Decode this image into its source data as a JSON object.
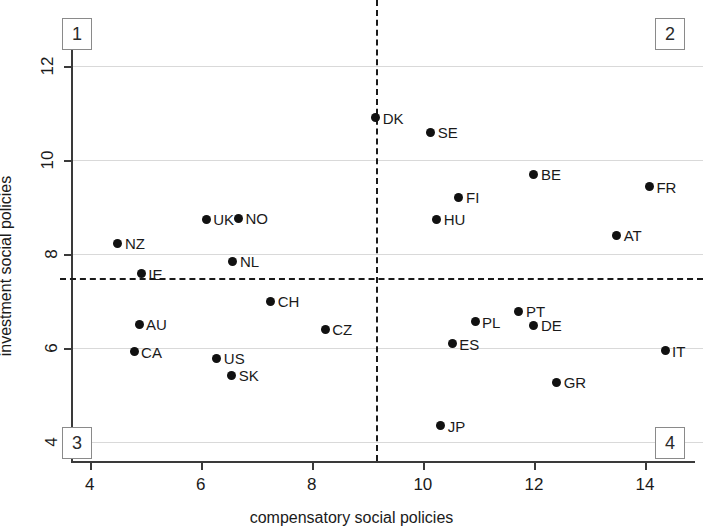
{
  "chart_data": {
    "type": "scatter",
    "title": "",
    "xlabel": "compensatory social policies",
    "ylabel": "investment social policies",
    "xlim": [
      3.7,
      14.9
    ],
    "ylim": [
      3.6,
      12.9
    ],
    "xticks": [
      4,
      6,
      8,
      10,
      12,
      14
    ],
    "yticks": [
      4,
      6,
      8,
      10,
      12
    ],
    "grid": true,
    "legend": "none",
    "reference_lines": {
      "vertical_x": 9.15,
      "horizontal_y": 7.5,
      "style": "dashed"
    },
    "quadrant_labels": [
      "1",
      "2",
      "3",
      "4"
    ],
    "points": [
      {
        "label": "DK",
        "x": 9.15,
        "y": 10.9,
        "label_side": "right"
      },
      {
        "label": "SE",
        "x": 10.14,
        "y": 10.6,
        "label_side": "right"
      },
      {
        "label": "BE",
        "x": 12.0,
        "y": 9.7,
        "label_side": "right"
      },
      {
        "label": "FR",
        "x": 14.08,
        "y": 9.44,
        "label_side": "right"
      },
      {
        "label": "FI",
        "x": 10.65,
        "y": 9.21,
        "label_side": "right"
      },
      {
        "label": "NO",
        "x": 6.68,
        "y": 8.77,
        "label_side": "right"
      },
      {
        "label": "UK",
        "x": 6.1,
        "y": 8.74,
        "label_side": "right"
      },
      {
        "label": "HU",
        "x": 10.25,
        "y": 8.74,
        "label_side": "right"
      },
      {
        "label": "AT",
        "x": 13.49,
        "y": 8.4,
        "label_side": "right"
      },
      {
        "label": "NZ",
        "x": 4.51,
        "y": 8.23,
        "label_side": "right"
      },
      {
        "label": "NL",
        "x": 6.58,
        "y": 7.85,
        "label_side": "right"
      },
      {
        "label": "IE",
        "x": 4.93,
        "y": 7.58,
        "label_side": "right"
      },
      {
        "label": "CH",
        "x": 7.26,
        "y": 7.0,
        "label_side": "right"
      },
      {
        "label": "PT",
        "x": 11.73,
        "y": 6.79,
        "label_side": "right"
      },
      {
        "label": "PL",
        "x": 10.94,
        "y": 6.56,
        "label_side": "right"
      },
      {
        "label": "AU",
        "x": 4.89,
        "y": 6.51,
        "label_side": "right"
      },
      {
        "label": "DE",
        "x": 12.0,
        "y": 6.49,
        "label_side": "right"
      },
      {
        "label": "CZ",
        "x": 8.24,
        "y": 6.4,
        "label_side": "right"
      },
      {
        "label": "ES",
        "x": 10.53,
        "y": 6.09,
        "label_side": "right"
      },
      {
        "label": "IT",
        "x": 14.36,
        "y": 5.95,
        "label_side": "right"
      },
      {
        "label": "CA",
        "x": 4.8,
        "y": 5.93,
        "label_side": "right"
      },
      {
        "label": "US",
        "x": 6.29,
        "y": 5.79,
        "label_side": "right"
      },
      {
        "label": "SK",
        "x": 6.56,
        "y": 5.42,
        "label_side": "right"
      },
      {
        "label": "GR",
        "x": 12.41,
        "y": 5.28,
        "label_side": "right"
      },
      {
        "label": "JP",
        "x": 10.32,
        "y": 4.35,
        "label_side": "right"
      }
    ],
    "colors": {
      "point": "#111111",
      "gridline": "#d9d9d9",
      "axis": "#3a3a3a",
      "reference_line": "#1a1a1a",
      "background": "#ffffff"
    }
  }
}
